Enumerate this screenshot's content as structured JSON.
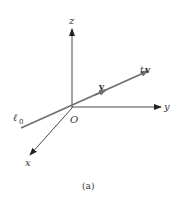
{
  "figure": {
    "caption": "(a)",
    "axes": {
      "z_label": "z",
      "y_label": "y",
      "x_label": "x",
      "origin_label": "O"
    },
    "line": {
      "label_main": "ℓ",
      "label_sub": "0",
      "vector_label": "v",
      "scaled_vector_t": "t",
      "scaled_vector_v": "v"
    },
    "colors": {
      "axis": "#333333",
      "line": "#707070",
      "text": "#333333"
    }
  }
}
